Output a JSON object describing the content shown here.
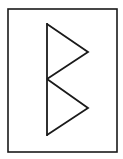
{
  "diagram": {
    "canvas": {
      "width": 123,
      "height": 159,
      "background": "#ffffff"
    },
    "stroke_color": "#1a1a1a",
    "frame": {
      "x": 8,
      "y": 9,
      "width": 109,
      "height": 143,
      "stroke_width": 1.6
    },
    "glyph": {
      "stroke_width": 1.8,
      "points": {
        "top": [
          47,
          24
        ],
        "upper_right": [
          88,
          52
        ],
        "middle": [
          47,
          79
        ],
        "lower_right": [
          88,
          108
        ],
        "bottom": [
          47,
          135
        ]
      },
      "shapes": [
        {
          "name": "spine",
          "from": "top",
          "to": "bottom"
        },
        {
          "name": "upper-triangle",
          "path": [
            "top",
            "upper_right",
            "middle"
          ]
        },
        {
          "name": "lower-triangle",
          "path": [
            "middle",
            "lower_right",
            "bottom"
          ]
        }
      ]
    }
  }
}
